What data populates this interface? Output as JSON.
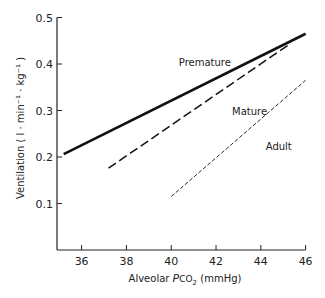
{
  "chart_data": {
    "type": "line",
    "title": "",
    "xlabel": "Alveolar PCO2 (mmHg)",
    "xlabel_parts": {
      "prefix": "Alveolar ",
      "italic": "P",
      "species": "CO",
      "sub": "2",
      "suffix": " (mmHg)"
    },
    "ylabel": "Ventilation ( l · min⁻¹ · kg⁻¹ )",
    "xlim": [
      34.9,
      46
    ],
    "ylim": [
      0,
      0.5
    ],
    "x_ticks": [
      36,
      38,
      40,
      42,
      44,
      46
    ],
    "y_ticks": [
      0.1,
      0.2,
      0.3,
      0.4,
      0.5
    ],
    "x_tick_labels": [
      "36",
      "38",
      "40",
      "42",
      "44",
      "46"
    ],
    "y_tick_labels": [
      "0.1",
      "0.2",
      "0.3",
      "0.4",
      "0.5"
    ],
    "grid": false,
    "legend": "inline labels",
    "series": [
      {
        "name": "Premature",
        "style": "solid",
        "x": [
          35.2,
          46.0
        ],
        "y": [
          0.206,
          0.465
        ],
        "label_pos": {
          "x": 41.5,
          "y": 0.395
        }
      },
      {
        "name": "Mature",
        "style": "dashed",
        "x": [
          37.2,
          45.2
        ],
        "y": [
          0.176,
          0.44
        ],
        "label_pos": {
          "x": 43.5,
          "y": 0.29
        }
      },
      {
        "name": "Adult",
        "style": "dotted-dash",
        "x": [
          40.0,
          46.0
        ],
        "y": [
          0.115,
          0.365
        ],
        "label_pos": {
          "x": 44.8,
          "y": 0.215
        }
      }
    ]
  }
}
